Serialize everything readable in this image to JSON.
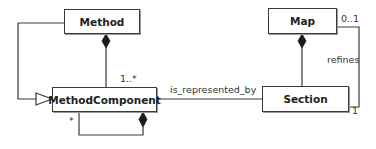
{
  "diagram": {
    "type": "UML class diagram",
    "classes": [
      {
        "id": "method",
        "name": "Method"
      },
      {
        "id": "method_component",
        "name": "MethodComponent"
      },
      {
        "id": "map",
        "name": "Map"
      },
      {
        "id": "section",
        "name": "Section"
      }
    ],
    "relations": [
      {
        "type": "composition",
        "from": "Method",
        "to": "MethodComponent",
        "target_multiplicity": "1..*"
      },
      {
        "type": "generalization",
        "from": "Method",
        "to": "MethodComponent"
      },
      {
        "type": "composition",
        "from": "MethodComponent",
        "to": "MethodComponent",
        "self_multiplicity": "*"
      },
      {
        "type": "association",
        "from": "MethodComponent",
        "to": "Section",
        "label": "is_represented_by"
      },
      {
        "type": "composition",
        "from": "Map",
        "to": "Section"
      },
      {
        "type": "association",
        "from": "Section",
        "to": "Map",
        "label": "refines",
        "map_multiplicity": "0..1",
        "section_multiplicity": "1"
      }
    ],
    "labels": {
      "mult_1_many": "1..*",
      "mult_star": "*",
      "assoc_represented": "is_represented_by",
      "assoc_refines": "refines",
      "mult_0_1": "0..1",
      "mult_1": "1"
    }
  }
}
